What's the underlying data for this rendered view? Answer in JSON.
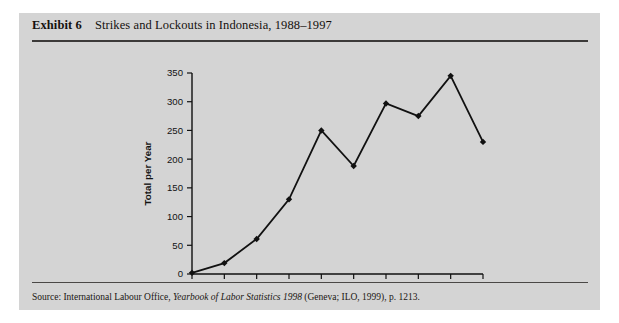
{
  "figure": {
    "label": "Exhibit 6",
    "title": "Strikes and Lockouts in Indonesia, 1988–1997",
    "source_prefix": "Source: International Labour Office, ",
    "source_italic": "Yearbook of Labor Statistics 1998",
    "source_suffix": " (Geneva; ILO, 1999), p. 1213.",
    "panel_color": "#d4d4d4",
    "ink_color": "#111111"
  },
  "chart_data": {
    "type": "line",
    "title": "Strikes and Lockouts in Indonesia, 1988–1997",
    "xlabel": "",
    "ylabel": "Total per Year",
    "categories": [
      "1988",
      "1989",
      "1990",
      "1991",
      "1992",
      "1993",
      "1994",
      "1995",
      "1996",
      "1997"
    ],
    "values": [
      2,
      19,
      61,
      130,
      250,
      188,
      297,
      275,
      345,
      230
    ],
    "x": [
      1988,
      1989,
      1990,
      1991,
      1992,
      1993,
      1994,
      1995,
      1996,
      1997
    ],
    "ylim": [
      0,
      350
    ],
    "yticks": [
      0,
      50,
      100,
      150,
      200,
      250,
      300,
      350
    ],
    "ytick_labels": [
      "0",
      "50",
      "100",
      "150",
      "200",
      "250",
      "300",
      "350"
    ],
    "xtick_labels": [
      "1988",
      "1989",
      "1990",
      "1991",
      "1992",
      "1993",
      "1994",
      "1995",
      "1996",
      "1997"
    ],
    "grid": false,
    "legend": null,
    "marker": "diamond",
    "line_color": "#111111"
  }
}
